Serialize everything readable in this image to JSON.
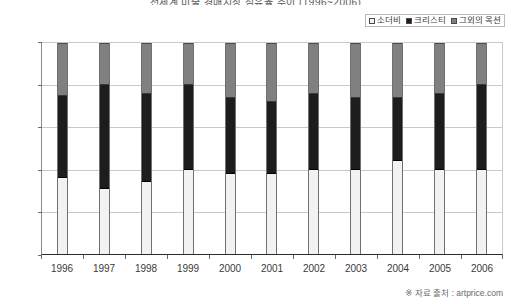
{
  "chart_data": {
    "type": "bar",
    "subtype": "stacked-100-percent",
    "title": "전세계 미술 경매시장 점유율 추이 (1996~2006)",
    "xlabel": "",
    "ylabel": "",
    "ylim": [
      0,
      100
    ],
    "ytick_labels": [
      "0%",
      "20%",
      "40%",
      "60%",
      "80%",
      "100%"
    ],
    "ytick_values": [
      0,
      20,
      40,
      60,
      80,
      100
    ],
    "grid": true,
    "legend_position": "top-right",
    "categories": [
      "1996",
      "1997",
      "1998",
      "1999",
      "2000",
      "2001",
      "2002",
      "2003",
      "2004",
      "2005",
      "2006"
    ],
    "series": [
      {
        "name": "소더비",
        "color": "#f2f2f2",
        "values": [
          36,
          31,
          34,
          40,
          38,
          38,
          40,
          40,
          44,
          40,
          40
        ]
      },
      {
        "name": "크리스티",
        "color": "#1d1d1d",
        "values": [
          39,
          49,
          42,
          40,
          36,
          34,
          36,
          34,
          30,
          36,
          40
        ]
      },
      {
        "name": "그외의 옥션",
        "color": "#808080",
        "values": [
          25,
          20,
          24,
          20,
          26,
          28,
          24,
          26,
          26,
          24,
          20
        ]
      }
    ],
    "annotations": [
      "※ 자료 출처 : artprice.com"
    ]
  },
  "legend": {
    "items": [
      {
        "label": "소더비",
        "swatch": "white-swatch-icon"
      },
      {
        "label": "크리스티",
        "swatch": "black-swatch-icon"
      },
      {
        "label": "그외의 옥션",
        "swatch": "gray-swatch-icon"
      }
    ]
  },
  "footer": {
    "source": "※ 자료 출처 : artprice.com"
  }
}
